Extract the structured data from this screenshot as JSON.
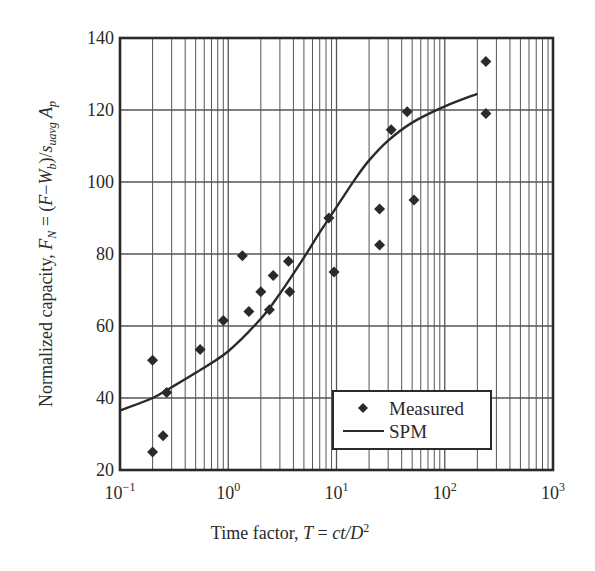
{
  "chart_data": {
    "type": "scatter",
    "title": "",
    "xlabel": "Time factor, T = ct/D²",
    "xlabel_parts": {
      "prefix": "Time factor, ",
      "var": "T",
      "eq": " = ",
      "expr": "ct/D",
      "sup": "2"
    },
    "ylabel": "Normalized capacity, F_N = (F−W_b)/s_uavg A_p",
    "ylabel_parts": {
      "prefix": "Normalized capacity, ",
      "F": "F",
      "F_sub": "N",
      "eq": " = (",
      "F2": "F",
      "minus": "−",
      "W": "W",
      "W_sub": "b",
      "close": ")/",
      "s": "s",
      "s_sub": "uavg",
      "A": " A",
      "A_sub": "p"
    },
    "xscale": "log",
    "xlim": [
      0.1,
      1000
    ],
    "ylim": [
      20,
      140
    ],
    "x_ticks": [
      {
        "value": 0.1,
        "base": "10",
        "exp": "−1"
      },
      {
        "value": 1,
        "base": "10",
        "exp": "0"
      },
      {
        "value": 10,
        "base": "10",
        "exp": "1"
      },
      {
        "value": 100,
        "base": "10",
        "exp": "2"
      },
      {
        "value": 1000,
        "base": "10",
        "exp": "3"
      }
    ],
    "y_ticks": [
      20,
      40,
      60,
      80,
      100,
      120,
      140
    ],
    "grid": true,
    "legend_position": "lower right",
    "series": [
      {
        "name": "Measured",
        "kind": "scatter",
        "marker": "diamond",
        "points": [
          [
            0.2,
            50.5
          ],
          [
            0.2,
            25
          ],
          [
            0.25,
            29.5
          ],
          [
            0.27,
            41.5
          ],
          [
            0.55,
            53.5
          ],
          [
            0.9,
            61.5
          ],
          [
            1.35,
            79.5
          ],
          [
            1.55,
            64
          ],
          [
            2.0,
            69.5
          ],
          [
            2.4,
            64.5
          ],
          [
            2.6,
            74
          ],
          [
            3.6,
            78
          ],
          [
            3.7,
            69.5
          ],
          [
            8.5,
            90
          ],
          [
            9.5,
            75
          ],
          [
            25,
            92.5
          ],
          [
            25,
            82.5
          ],
          [
            32,
            114.5
          ],
          [
            45,
            119.5
          ],
          [
            52,
            95
          ],
          [
            240,
            133.5
          ],
          [
            240,
            119
          ]
        ]
      },
      {
        "name": "SPM",
        "kind": "line",
        "points": [
          [
            0.1,
            36.5
          ],
          [
            0.2,
            40
          ],
          [
            0.3,
            43
          ],
          [
            0.5,
            47
          ],
          [
            1.0,
            53
          ],
          [
            2.0,
            62
          ],
          [
            3.0,
            69
          ],
          [
            5.0,
            79
          ],
          [
            7.0,
            86
          ],
          [
            10.0,
            93
          ],
          [
            15.0,
            101
          ],
          [
            20.0,
            106
          ],
          [
            30.0,
            111.5
          ],
          [
            50.0,
            116.5
          ],
          [
            100.0,
            121
          ],
          [
            200.0,
            124.5
          ]
        ]
      }
    ]
  },
  "legend": {
    "items": [
      {
        "label": "Measured",
        "symbol": "diamond"
      },
      {
        "label": "SPM",
        "symbol": "line"
      }
    ]
  },
  "colors": {
    "ink": "#2a2a2a",
    "grid": "#555555",
    "background": "#ffffff"
  }
}
